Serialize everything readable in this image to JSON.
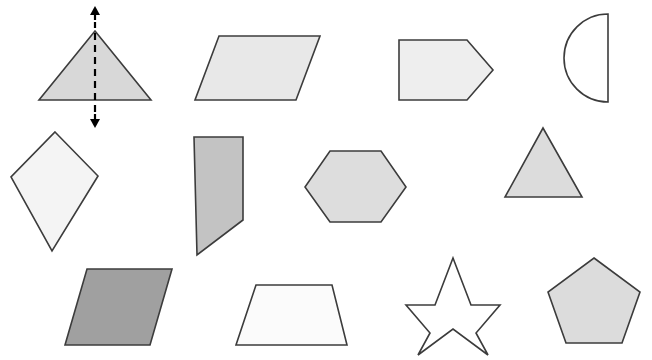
{
  "page": {
    "width": 652,
    "height": 360,
    "background_color": "#ffffff"
  },
  "style": {
    "stroke_color": "#3c3c3c",
    "stroke_width": 1.6,
    "fill_white": "#ffffff",
    "fill_lightest": "#f2f2f2",
    "fill_light": "#e8e8e8",
    "fill_medium_light": "#dcdcdc",
    "fill_medium": "#c9c9c9",
    "fill_dark": "#a0a0a0",
    "symmetry_line_color": "#000000"
  },
  "rows": [
    {
      "row_index": 1,
      "shapes": [
        {
          "id": "shape-1",
          "name": "isosceles-triangle-with-line-of-symmetry",
          "label": "Isosceles triangle",
          "kind": "polygon",
          "fill": "#d8d8d8",
          "points": "95,31 151,100 39,100",
          "annotation": {
            "type": "line-of-symmetry",
            "line": {
              "x1": 95,
              "y1": 112,
              "x2": 95,
              "y2": 22
            },
            "dash_pattern": "7 5",
            "arrow_top": {
              "x": 95,
              "y": 6
            },
            "arrow_bottom": {
              "x": 95,
              "y": 128
            }
          }
        },
        {
          "id": "shape-2",
          "name": "parallelogram-wide",
          "label": "Parallelogram",
          "kind": "polygon",
          "fill": "#e8e8e8",
          "points": "219,36 320,36 296,100 195,100"
        },
        {
          "id": "shape-3",
          "name": "pentagon-arrow-right",
          "label": "Pentagon (arrow shape)",
          "kind": "polygon",
          "fill": "#eeeeee",
          "points": "399,40 467,40 493,70 467,100 399,100"
        },
        {
          "id": "shape-4",
          "name": "semicircle",
          "label": "Semicircle",
          "kind": "path",
          "fill": "#ffffff",
          "d": "M 608,14 A 44 44 0 0 0 608,102 Z"
        }
      ]
    },
    {
      "row_index": 2,
      "shapes": [
        {
          "id": "shape-5",
          "name": "kite",
          "label": "Kite",
          "kind": "polygon",
          "fill": "#f4f4f4",
          "points": "55,132 98,176 52,251 11,177"
        },
        {
          "id": "shape-6",
          "name": "right-trapezoid",
          "label": "Right trapezoid",
          "kind": "polygon",
          "fill": "#c3c3c3",
          "points": "194,137 243,137 243,220 197,255"
        },
        {
          "id": "shape-7",
          "name": "hexagon",
          "label": "Hexagon",
          "kind": "polygon",
          "fill": "#dddddd",
          "points": "330,151 381,151 406,187 381,222 330,222 305,187"
        },
        {
          "id": "shape-8",
          "name": "equilateral-triangle",
          "label": "Triangle",
          "kind": "polygon",
          "fill": "#dcdcdc",
          "points": "543,128 582,197 505,197"
        }
      ]
    },
    {
      "row_index": 3,
      "shapes": [
        {
          "id": "shape-9",
          "name": "parallelogram-dark",
          "label": "Parallelogram (shaded)",
          "kind": "polygon",
          "fill": "#a0a0a0",
          "points": "87,269 172,269 150,345 65,345"
        },
        {
          "id": "shape-10",
          "name": "trapezoid-isosceles",
          "label": "Trapezoid",
          "kind": "polygon",
          "fill": "#fbfbfb",
          "points": "256,285 332,285 347,345 236,345"
        },
        {
          "id": "shape-11",
          "name": "five-pointed-star",
          "label": "Five-pointed star",
          "kind": "polygon",
          "fill": "#ffffff",
          "points": "453,258 471,305 500,305 476,333 488,355 453,329 418,355 430,333 406,305 435,305"
        },
        {
          "id": "shape-12",
          "name": "pentagon-regular",
          "label": "Regular pentagon",
          "kind": "polygon",
          "fill": "#dcdcdc",
          "points": "594,258 640,292 622,343 566,343 548,292"
        }
      ]
    }
  ]
}
